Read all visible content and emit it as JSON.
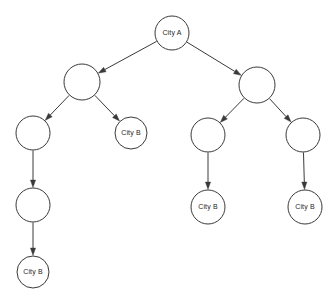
{
  "diagram": {
    "type": "tree",
    "title": "",
    "canvas": {
      "width": 335,
      "height": 306,
      "background": "#ffffff"
    },
    "style": {
      "node_fill": "#ffffff",
      "node_stroke": "#3a3a3a",
      "node_stroke_width": 1,
      "edge_color": "#3a3a3a",
      "label_color": "#1e1e1e",
      "label_font_size": 7
    },
    "labels": {
      "root": "City A",
      "leaf": "City B"
    },
    "nodes": [
      {
        "id": "n0",
        "label": "City A",
        "cx": 172,
        "cy": 33,
        "r": 17,
        "level": 0
      },
      {
        "id": "n1",
        "label": "",
        "cx": 82,
        "cy": 82,
        "r": 18,
        "level": 1
      },
      {
        "id": "n2",
        "label": "",
        "cx": 257,
        "cy": 85,
        "r": 18,
        "level": 1
      },
      {
        "id": "n3",
        "label": "",
        "cx": 33,
        "cy": 133,
        "r": 17,
        "level": 2
      },
      {
        "id": "n4",
        "label": "City B",
        "cx": 131,
        "cy": 133,
        "r": 16,
        "level": 2
      },
      {
        "id": "n5",
        "label": "",
        "cx": 208,
        "cy": 135,
        "r": 17,
        "level": 2
      },
      {
        "id": "n6",
        "label": "",
        "cx": 303,
        "cy": 135,
        "r": 17,
        "level": 2
      },
      {
        "id": "n7",
        "label": "",
        "cx": 33,
        "cy": 205,
        "r": 17,
        "level": 3
      },
      {
        "id": "n8",
        "label": "City B",
        "cx": 208,
        "cy": 207,
        "r": 17,
        "level": 3
      },
      {
        "id": "n9",
        "label": "City B",
        "cx": 305,
        "cy": 207,
        "r": 17,
        "level": 3
      },
      {
        "id": "n10",
        "label": "City B",
        "cx": 33,
        "cy": 272,
        "r": 16,
        "level": 4
      }
    ],
    "edges": [
      {
        "id": "e0",
        "from": "n0",
        "to": "n1",
        "directed": true
      },
      {
        "id": "e1",
        "from": "n0",
        "to": "n2",
        "directed": true
      },
      {
        "id": "e2",
        "from": "n1",
        "to": "n3",
        "directed": true
      },
      {
        "id": "e3",
        "from": "n1",
        "to": "n4",
        "directed": true
      },
      {
        "id": "e4",
        "from": "n2",
        "to": "n5",
        "directed": true
      },
      {
        "id": "e5",
        "from": "n2",
        "to": "n6",
        "directed": true
      },
      {
        "id": "e6",
        "from": "n3",
        "to": "n7",
        "directed": true
      },
      {
        "id": "e7",
        "from": "n5",
        "to": "n8",
        "directed": true
      },
      {
        "id": "e8",
        "from": "n6",
        "to": "n9",
        "directed": true
      },
      {
        "id": "e9",
        "from": "n7",
        "to": "n10",
        "directed": true
      }
    ]
  }
}
